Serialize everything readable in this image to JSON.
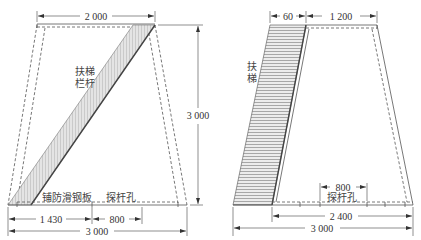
{
  "left_view": {
    "dims": {
      "top_width": "2 000",
      "height": "3 000",
      "bottom_segment_a": "1 430",
      "bottom_segment_b": "800",
      "bottom_width": "3 000"
    },
    "labels": {
      "ladder_rail_line1": "扶梯",
      "ladder_rail_line2": "栏杆",
      "anti_slip_plate": "铺防滑钢板",
      "probe_hole": "探杆孔"
    }
  },
  "right_view": {
    "dims": {
      "ladder_width": "60",
      "top_width": "1 200",
      "probe_hole_width": "800",
      "inner_bottom_width": "2 400",
      "bottom_width": "3 000"
    },
    "labels": {
      "ladder_line1": "扶",
      "ladder_line2": "梯",
      "probe_hole": "探杆孔"
    }
  },
  "colors": {
    "line": "#555555",
    "hatch": "#888888",
    "fill": "#e6e6e6",
    "background": "#ffffff"
  }
}
